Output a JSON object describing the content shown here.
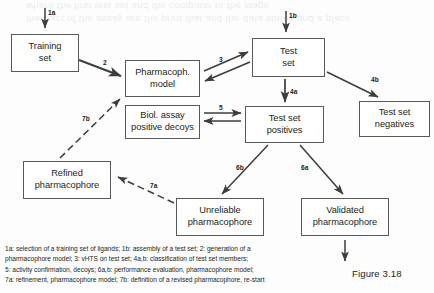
{
  "figure": {
    "caption_label": "Figure 3.18",
    "bleed_text_line1": "the tract of the assay are the print that and the data states and a place",
    "bleed_text_line2": "where the first test set and the computer to the stage"
  },
  "nodes": [
    {
      "id": "training-set",
      "label": "Training\nset",
      "x": 11,
      "y": 34,
      "w": 68,
      "h": 38
    },
    {
      "id": "pharmacophore-model",
      "label": "Pharmacoph.\nmodel",
      "x": 125,
      "y": 60,
      "w": 75,
      "h": 37
    },
    {
      "id": "biol-assay-decoys",
      "label": "Biol. assay\npositive decoys",
      "x": 125,
      "y": 105,
      "w": 75,
      "h": 34
    },
    {
      "id": "test-set",
      "label": "Test\nset",
      "x": 252,
      "y": 38,
      "w": 73,
      "h": 39
    },
    {
      "id": "test-set-positives",
      "label": "Test set\npositives",
      "x": 245,
      "y": 106,
      "w": 79,
      "h": 37
    },
    {
      "id": "test-set-negatives",
      "label": "Test set\nnegatives",
      "x": 359,
      "y": 101,
      "w": 71,
      "h": 36
    },
    {
      "id": "refined-pharmacophore",
      "label": "Refined\npharmacophore",
      "x": 23,
      "y": 161,
      "w": 88,
      "h": 38
    },
    {
      "id": "unreliable-pharmacophore",
      "label": "Unreliable\npharmacophore",
      "x": 176,
      "y": 198,
      "w": 88,
      "h": 38
    },
    {
      "id": "validated-pharmacophore",
      "label": "Validated\npharmacophore",
      "x": 301,
      "y": 198,
      "w": 88,
      "h": 38
    }
  ],
  "edge_labels": [
    {
      "id": "1a",
      "text": "1a",
      "x": 48,
      "y": 9
    },
    {
      "id": "1b",
      "text": "1b",
      "x": 289,
      "y": 12
    },
    {
      "id": "2",
      "text": "2",
      "x": 103,
      "y": 59
    },
    {
      "id": "3",
      "text": "3",
      "x": 219,
      "y": 56
    },
    {
      "id": "4a",
      "text": "4a",
      "x": 290,
      "y": 88
    },
    {
      "id": "4b",
      "text": "4b",
      "x": 371,
      "y": 76
    },
    {
      "id": "5",
      "text": "5",
      "x": 219,
      "y": 104
    },
    {
      "id": "6b",
      "text": "6b",
      "x": 236,
      "y": 164
    },
    {
      "id": "6a",
      "text": "6a",
      "x": 301,
      "y": 164
    },
    {
      "id": "7a",
      "text": "7a",
      "x": 150,
      "y": 182
    },
    {
      "id": "7b",
      "text": "7b",
      "x": 82,
      "y": 115
    }
  ],
  "legend": {
    "text": "1a: selection of a training set of ligands; 1b: assembly of a test set; 2: generation of a\npharmacophore model; 3: vHTS on test set; 4a,b: classification of test set members;\n5: activity confirmation, decoys; 6a,b: performance evaluation, pharmacophore model;\n7a: refinement, pharmacophore model; 7b: definition of a revised pharmacophore, re-start"
  }
}
